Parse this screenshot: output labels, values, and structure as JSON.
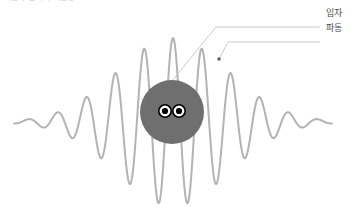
{
  "figure": {
    "title_clipped": "파동과 입자의 이중성",
    "background_color": "#ffffff",
    "width": 356,
    "height": 212
  },
  "wave": {
    "label": "파동",
    "stroke_color": "#b3b3b3",
    "stroke_width": 2,
    "centerline_y": 122,
    "x_start": 14,
    "x_end": 332,
    "max_amplitude": 84,
    "cycles": 11,
    "envelope": "gaussian",
    "marker_dot": {
      "x": 219,
      "y": 59,
      "color": "#5a5a5a",
      "size": 3
    },
    "leader_color": "#c4c4c4"
  },
  "particle": {
    "label": "입자",
    "center_x": 172,
    "center_y": 112,
    "radius": 32,
    "fill_color": "#6f6f6f",
    "eyes": [
      {
        "cx": 165,
        "cy": 111,
        "r": 6.2,
        "pupil_r": 3.1
      },
      {
        "cx": 179,
        "cy": 111,
        "r": 6.2,
        "pupil_r": 3.1
      }
    ],
    "eye_fill": "#ffffff",
    "eye_outline": "#000000",
    "pupil_color": "#000000",
    "leader_color": "#c4c4c4"
  },
  "callouts": [
    {
      "name": "particle",
      "label": "입자",
      "label_x": 326,
      "label_y": 8,
      "line_points": "172,81 216,27 320,27"
    },
    {
      "name": "wave",
      "label": "파동",
      "label_x": 326,
      "label_y": 23,
      "line_points": "219,59 228,42 320,42"
    }
  ]
}
